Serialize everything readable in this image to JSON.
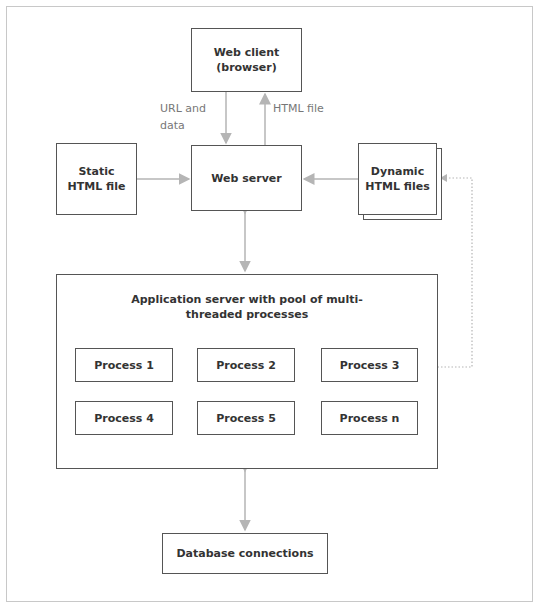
{
  "caption": "Figure — Web application architecture",
  "nodes": {
    "web_client": "Web client\n(browser)",
    "web_client_line1": "Web client",
    "web_client_line2": "(browser)",
    "web_server": "Web server",
    "static_html_line1": "Static",
    "static_html_line2": "HTML file",
    "dynamic_html_line1": "Dynamic",
    "dynamic_html_line2": "HTML files",
    "app_server_line1": "Application server with pool of multi-",
    "app_server_line2": "threaded processes",
    "database": "Database connections"
  },
  "processes": [
    "Process 1",
    "Process 2",
    "Process 3",
    "Process 4",
    "Process 5",
    "Process n"
  ],
  "edge_labels": {
    "url_line1": "URL and",
    "url_line2": "data",
    "html_file": "HTML file"
  },
  "colors": {
    "box_border": "#555555",
    "arrow": "#b5b5b5",
    "frame": "#c8c8c8",
    "text": "#333333"
  }
}
